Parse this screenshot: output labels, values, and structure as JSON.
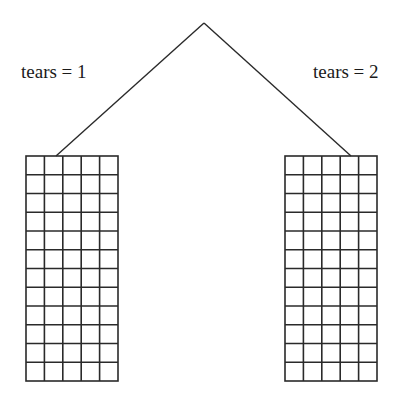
{
  "diagram": {
    "type": "tree-split",
    "root": {
      "apex": {
        "x": 204,
        "y": 23
      }
    },
    "branches": [
      {
        "label": "tears = 1",
        "attach": {
          "x": 56,
          "y": 156
        },
        "grid": {
          "x": 26,
          "y": 156,
          "width": 92,
          "height": 225,
          "cols": 5,
          "rows": 12
        }
      },
      {
        "label": "tears = 2",
        "attach": {
          "x": 351,
          "y": 156
        },
        "grid": {
          "x": 285,
          "y": 156,
          "width": 92,
          "height": 225,
          "cols": 5,
          "rows": 12
        }
      }
    ],
    "colors": {
      "line": "#2a2a2a",
      "background": "#ffffff"
    }
  }
}
